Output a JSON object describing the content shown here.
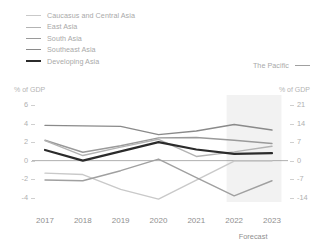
{
  "legend": {
    "items": [
      {
        "label": "Caucasus and Central Asia",
        "color": "#c9c9c9",
        "width": 1.4
      },
      {
        "label": "East Asia",
        "color": "#b3b3b3",
        "width": 1.4
      },
      {
        "label": "South Asia",
        "color": "#9a9a9a",
        "width": 1.4
      },
      {
        "label": "Southeast Asia",
        "color": "#8a8a8a",
        "width": 1.4
      },
      {
        "label": "Developing Asia",
        "color": "#2b2b2b",
        "width": 2.2
      }
    ],
    "right_item": {
      "label": "The Pacific",
      "color": "#a0a0a0",
      "width": 1.4
    }
  },
  "chart_data": {
    "type": "line",
    "title": "",
    "xlabel": "",
    "ylabel": "% of GDP",
    "y2label": "% of GDP",
    "x": [
      2017,
      2018,
      2019,
      2020,
      2021,
      2022,
      2023
    ],
    "xtick_labels": [
      "2017",
      "2018",
      "2019",
      "2020",
      "2021",
      "2022",
      "2023"
    ],
    "ylim": [
      -5,
      6
    ],
    "yticks": [
      6,
      4,
      2,
      0,
      -2,
      -4
    ],
    "ytick_labels": [
      "6",
      "4",
      "2",
      "0",
      "-2",
      "-4"
    ],
    "y2lim": [
      -17.5,
      21
    ],
    "y2ticks": [
      21,
      14,
      7,
      0,
      -7,
      -14
    ],
    "y2tick_labels": [
      "21",
      "14",
      "7",
      "0",
      "-7",
      "-14"
    ],
    "grid": false,
    "zero_line": true,
    "legend_position": "top-left",
    "forecast_label": "Forecast",
    "forecast_start": 2021.8,
    "forecast_end": 2023.25,
    "series": [
      {
        "name": "Southeast Asia",
        "axis": "left",
        "color": "#8a8a8a",
        "width": 1.4,
        "values": [
          3.8,
          3.75,
          3.7,
          2.8,
          3.2,
          3.9,
          3.3
        ]
      },
      {
        "name": "South Asia",
        "axis": "left",
        "color": "#9a9a9a",
        "width": 1.4,
        "values": [
          2.2,
          0.9,
          1.6,
          2.45,
          2.5,
          2.2,
          1.85
        ]
      },
      {
        "name": "East Asia",
        "axis": "left",
        "color": "#b3b3b3",
        "width": 1.4,
        "values": [
          2.15,
          0.55,
          1.45,
          2.3,
          0.45,
          0.95,
          1.55
        ]
      },
      {
        "name": "Developing Asia",
        "axis": "left",
        "color": "#2b2b2b",
        "width": 2.2,
        "values": [
          1.15,
          0.0,
          1.0,
          2.0,
          1.2,
          0.72,
          0.8
        ]
      },
      {
        "name": "Caucasus and Central Asia",
        "axis": "left",
        "color": "#c9c9c9",
        "width": 1.4,
        "values": [
          -1.35,
          -1.5,
          -3.1,
          -4.15,
          -2.1,
          -0.05,
          -0.05
        ]
      },
      {
        "name": "The Pacific",
        "axis": "right",
        "color": "#a0a0a0",
        "width": 1.4,
        "values": [
          -7.3,
          -7.6,
          -3.8,
          0.6,
          -6.4,
          -13.3,
          -7.6
        ]
      }
    ]
  }
}
